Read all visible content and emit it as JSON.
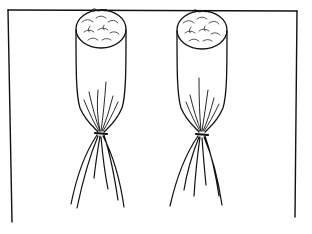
{
  "illustration": {
    "subject": "two tied cloth bags hanging from a line",
    "ink_color": "#111111",
    "background_color": "#ffffff",
    "items": [
      {
        "name": "left-bag"
      },
      {
        "name": "right-bag"
      }
    ]
  }
}
